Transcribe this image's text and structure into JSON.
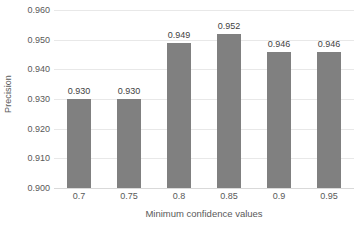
{
  "chart_data": {
    "type": "bar",
    "title": "",
    "xlabel": "Minimum confidence values",
    "ylabel": "Precision",
    "categories": [
      "0.7",
      "0.75",
      "0.8",
      "0.85",
      "0.9",
      "0.95"
    ],
    "values": [
      0.93,
      0.93,
      0.949,
      0.952,
      0.946,
      0.946
    ],
    "value_labels": [
      "0.930",
      "0.930",
      "0.949",
      "0.952",
      "0.946",
      "0.946"
    ],
    "ylim": [
      0.9,
      0.96
    ],
    "ytick_labels": [
      "0.960",
      "0.950",
      "0.940",
      "0.930",
      "0.920",
      "0.910",
      "0.900"
    ],
    "ytick_values": [
      0.96,
      0.95,
      0.94,
      0.93,
      0.92,
      0.91,
      0.9
    ],
    "grid": true,
    "legend": false,
    "series_color": "#808080",
    "gridline_color": "#e8e8e8",
    "text_color": "#595959",
    "label_color": "#3f3f3f",
    "background": "#ffffff"
  }
}
